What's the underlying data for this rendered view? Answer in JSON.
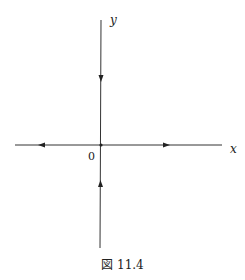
{
  "figure": {
    "caption": "図 11.4",
    "labels": {
      "x_axis": "x",
      "y_axis": "y",
      "origin": "0"
    },
    "type": "phase-portrait-saddle",
    "arrows": [
      {
        "location": "positive-y-axis",
        "direction": "toward-origin"
      },
      {
        "location": "negative-y-axis",
        "direction": "toward-origin"
      },
      {
        "location": "negative-x-axis",
        "direction": "away-from-origin"
      },
      {
        "location": "positive-x-axis",
        "direction": "away-from-origin"
      }
    ],
    "colors": {
      "line": "#333333",
      "background": "#ffffff"
    }
  }
}
